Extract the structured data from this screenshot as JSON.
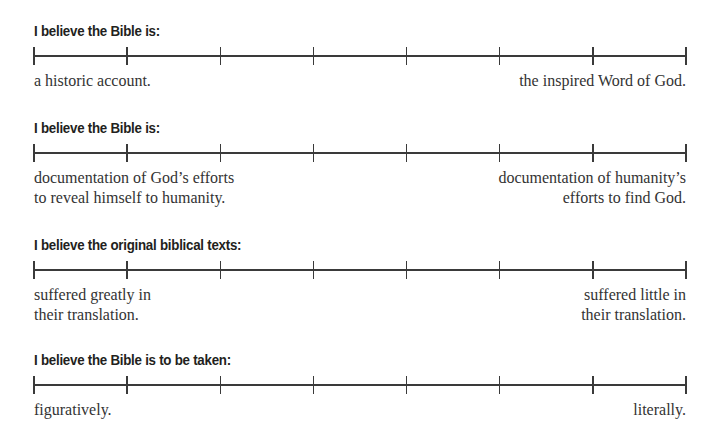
{
  "scales": [
    {
      "title": "I believe the Bible is:",
      "left_label": "a historic account.",
      "right_label": "the inspired Word of God.",
      "tick_count": 8
    },
    {
      "title": "I believe the Bible is:",
      "left_label": "documentation of God’s efforts\nto reveal himself to humanity.",
      "right_label": "documentation of humanity’s\nefforts to find God.",
      "tick_count": 8
    },
    {
      "title": "I believe the original biblical texts:",
      "left_label": "suffered greatly in\ntheir translation.",
      "right_label": "suffered little in\ntheir translation.",
      "tick_count": 8
    },
    {
      "title": "I believe the Bible is to be taken:",
      "left_label": "figuratively.",
      "right_label": "literally.",
      "tick_count": 8
    }
  ],
  "colors": {
    "text": "#231f20",
    "line": "#3a3a3a",
    "background": "#ffffff"
  }
}
